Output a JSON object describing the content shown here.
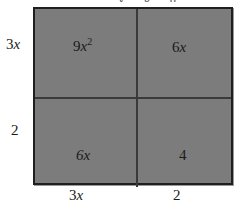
{
  "diagram": {
    "type": "area-model",
    "top_fragment_text": "y g p",
    "cells": [
      {
        "row": 0,
        "col": 0,
        "coef": "9",
        "var": "x",
        "exp": "2"
      },
      {
        "row": 0,
        "col": 1,
        "coef": "6",
        "var": "x",
        "exp": ""
      },
      {
        "row": 1,
        "col": 0,
        "coef": "6",
        "var": "x",
        "exp": ""
      },
      {
        "row": 1,
        "col": 1,
        "coef": "4",
        "var": "",
        "exp": ""
      }
    ],
    "left_labels": [
      {
        "coef": "3",
        "var": "x"
      },
      {
        "coef": "2",
        "var": ""
      }
    ],
    "bottom_labels": [
      {
        "coef": "3",
        "var": "x"
      },
      {
        "coef": "2",
        "var": ""
      }
    ],
    "colors": {
      "fill": "#7c7c7c",
      "border": "#1f1f1f",
      "divider": "#3a3a3a",
      "text": "#1a1a1a"
    }
  }
}
